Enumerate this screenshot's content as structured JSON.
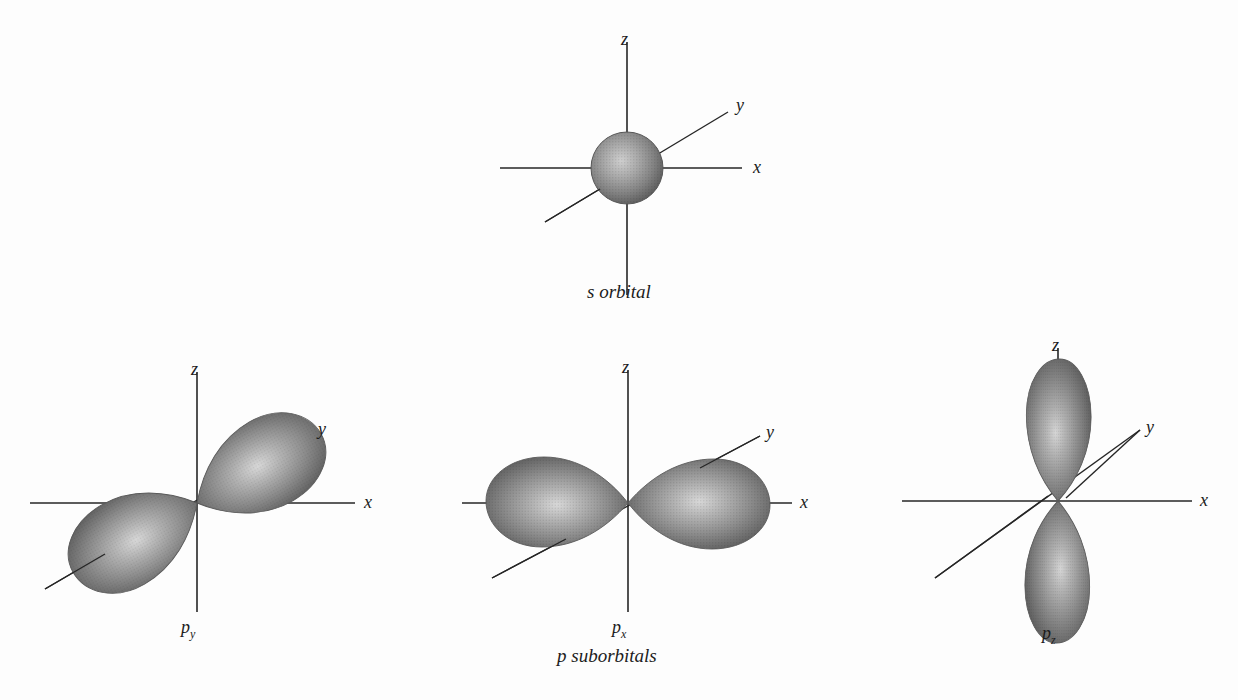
{
  "diagram": {
    "title_text": "",
    "background_color": "#fdfdfd",
    "line_color": "#262626",
    "orbital_fill_dark": "#6e6e6e",
    "orbital_fill_mid": "#8a8a8a",
    "orbital_fill_light": "#c9c9c9",
    "orbital_highlight": "#dcdcdc"
  },
  "s_orbital": {
    "name": "s-orbital",
    "caption": "s orbital",
    "axes": {
      "z_label": "z",
      "x_label": "x",
      "y_label": "y"
    }
  },
  "p_suborbitals": {
    "caption": "p suborbitals",
    "orbitals": [
      {
        "name": "py-orbital",
        "label_base": "p",
        "label_sub": "y",
        "axes": {
          "z_label": "z",
          "x_label": "x",
          "y_label": "y"
        },
        "lobe_axis": "y"
      },
      {
        "name": "px-orbital",
        "label_base": "p",
        "label_sub": "x",
        "axes": {
          "z_label": "z",
          "x_label": "x",
          "y_label": "y"
        },
        "lobe_axis": "x"
      },
      {
        "name": "pz-orbital",
        "label_base": "p",
        "label_sub": "z",
        "axes": {
          "z_label": "z",
          "x_label": "x",
          "y_label": "y"
        },
        "lobe_axis": "z"
      }
    ]
  }
}
